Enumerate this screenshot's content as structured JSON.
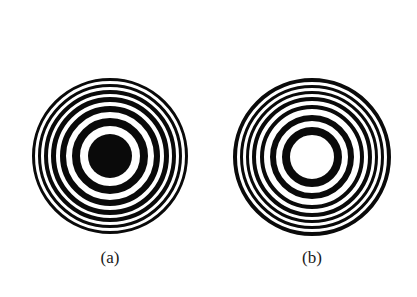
{
  "figure": {
    "background": "#ffffff",
    "ink": "#0a0a0a",
    "panels": [
      {
        "id": "a",
        "caption": "(a)",
        "caption_pos": {
          "x": 110,
          "y": 256
        },
        "center": {
          "x": 110,
          "y": 156
        },
        "center_type": "dark",
        "outer_radius": 80,
        "dark_rings": [
          {
            "r_in": 0,
            "r_out": 22
          },
          {
            "r_in": 30,
            "r_out": 38
          },
          {
            "r_in": 44,
            "r_out": 50
          },
          {
            "r_in": 54,
            "r_out": 59
          },
          {
            "r_in": 62,
            "r_out": 66
          },
          {
            "r_in": 69,
            "r_out": 72
          },
          {
            "r_in": 75,
            "r_out": 78
          }
        ]
      },
      {
        "id": "b",
        "caption": "(b)",
        "caption_pos": {
          "x": 312,
          "y": 256
        },
        "center": {
          "x": 312,
          "y": 157
        },
        "center_type": "bright",
        "outer_radius": 80,
        "dark_rings": [
          {
            "r_in": 22,
            "r_out": 30
          },
          {
            "r_in": 36,
            "r_out": 42
          },
          {
            "r_in": 48,
            "r_out": 52
          },
          {
            "r_in": 56,
            "r_out": 60
          },
          {
            "r_in": 63,
            "r_out": 66
          },
          {
            "r_in": 69,
            "r_out": 72
          },
          {
            "r_in": 75,
            "r_out": 79
          }
        ]
      }
    ]
  }
}
